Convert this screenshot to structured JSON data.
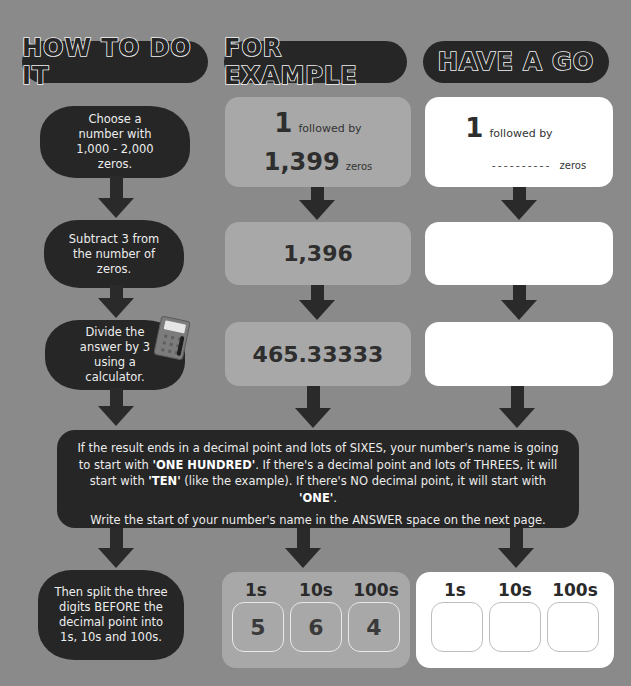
{
  "headers": {
    "how": "HOW TO DO IT",
    "example": "FOR EXAMPLE",
    "go": "HAVE A GO"
  },
  "steps": [
    "Choose a number with 1,000 - 2,000 zeros.",
    "Subtract 3 from the number of zeros.",
    "Divide the answer by 3 using a calculator.",
    "Then split the three digits BEFORE the decimal point into 1s, 10s and 100s."
  ],
  "example": {
    "row1": {
      "one": "1",
      "followed_by": "followed by",
      "zeros_count": "1,399",
      "zeros_label": "zeros"
    },
    "row2": "1,396",
    "row3": "465.33333",
    "digits": {
      "labels": [
        "1s",
        "10s",
        "100s"
      ],
      "values": [
        "5",
        "6",
        "4"
      ]
    }
  },
  "have_a_go": {
    "row1": {
      "one": "1",
      "followed_by": "followed by",
      "blank": "----------",
      "zeros_label": "zeros"
    },
    "row2": "",
    "row3": "",
    "digits": {
      "labels": [
        "1s",
        "10s",
        "100s"
      ],
      "values": [
        "",
        "",
        ""
      ]
    }
  },
  "result_box": {
    "p1_a": "If the result ends in a decimal point and lots of SIXES, your number's name is going to start with ",
    "p1_b": "'ONE HUNDRED'",
    "p1_c": ". If there's a decimal point and lots of THREES, it will start with ",
    "p1_d": "'TEN'",
    "p1_e": " (like the example). If there's NO decimal point, it will start with ",
    "p1_f": "'ONE'",
    "p1_g": ".",
    "p2": "Write the start of your number's name in the ANSWER space on the next page."
  },
  "colors": {
    "background": "#8a8a8a",
    "dark": "#262626",
    "example_box": "#a8a8a8",
    "go_box": "#ffffff"
  },
  "icons": [
    "calculator-icon",
    "arrow-down-icon"
  ]
}
